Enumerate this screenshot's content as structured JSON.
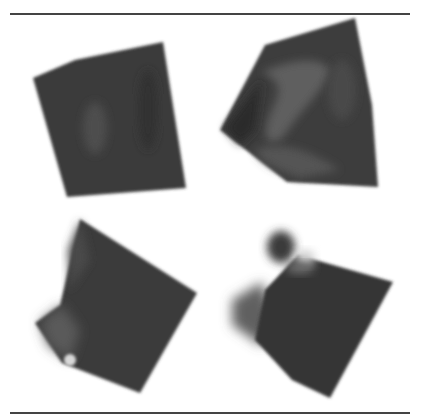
{
  "figure": {
    "layout": "2x2 grid of volumetric renderings between horizontal rules",
    "rules": {
      "top_y": 13,
      "bottom_y": 412,
      "color": "#444444"
    },
    "panels": [
      {
        "id": "top-left",
        "description": "dark cube-like volume, nearly frontal view",
        "fill": "#3a3a3a",
        "highlight": "#555555",
        "points": "33,78 75,60 163,42 186,188 67,197"
      },
      {
        "id": "top-right",
        "description": "cube volume viewed from a corner with swirling lighter internal structure",
        "fill": "#3c3c3c",
        "highlight": "#6a6a6a",
        "points": "220,130 265,45 355,18 372,105 378,187 287,182"
      },
      {
        "id": "bottom-left",
        "description": "rotated cube volume with soft blurred left edge",
        "fill": "#3b3b3b",
        "highlight": "#5c5c5c",
        "points": "80,219 197,293 140,393 62,363 35,323 60,305"
      },
      {
        "id": "bottom-right",
        "description": "rotated cube volume with a rounded blob near top-left and blurred left lobe",
        "fill": "#363636",
        "highlight": "#6f6f6f",
        "points": "298,255 393,282 330,398 292,380 255,340 265,290"
      }
    ],
    "extra_shapes": {
      "bottom_right_blob": {
        "cx": 281,
        "cy": 247,
        "rx": 14,
        "ry": 16,
        "fill": "#3a3a3a"
      },
      "bottom_right_lobe": {
        "points": "232,300 262,282 275,320 262,346 232,325",
        "fill": "#606060"
      }
    }
  }
}
